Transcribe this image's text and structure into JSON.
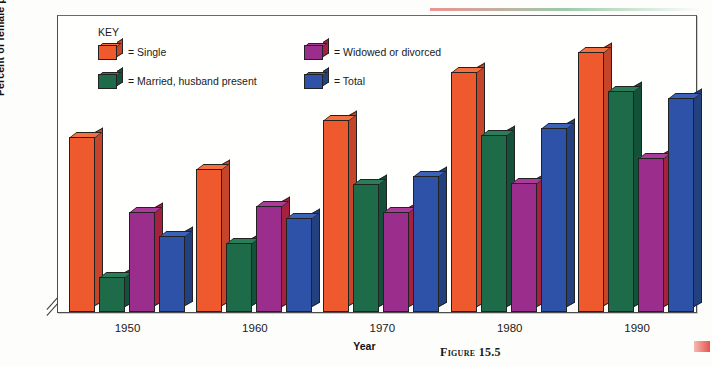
{
  "figure": {
    "caption": "Figure 15.5"
  },
  "chart_data": {
    "type": "bar",
    "title": "",
    "xlabel": "Year",
    "ylabel": "Percent of female population working",
    "categories": [
      "1950",
      "1960",
      "1970",
      "1980",
      "1990"
    ],
    "ylim": [
      17.5,
      72.5
    ],
    "yticks": [
      70,
      65,
      60,
      55,
      50,
      45,
      40,
      35,
      30,
      25,
      20
    ],
    "y_axis_break": true,
    "grid": false,
    "legend_position": "inside-top-left",
    "legend_title": "KEY",
    "series": [
      {
        "name": "Single",
        "label": "= Single",
        "color": "#EE5A2E",
        "values": [
          50.0,
          44.0,
          53.2,
          62.2,
          65.8
        ]
      },
      {
        "name": "Married, husband present",
        "label": "= Married, husband present",
        "color": "#1E6B4A",
        "values": [
          24.0,
          30.2,
          41.3,
          50.5,
          58.7
        ]
      },
      {
        "name": "Widowed or divorced",
        "label": "= Widowed or divorced",
        "color": "#9B2D8C",
        "values": [
          36.0,
          37.2,
          36.1,
          41.5,
          46.2
        ]
      },
      {
        "name": "Total",
        "label": "= Total",
        "color": "#2E52A8",
        "values": [
          31.5,
          35.0,
          42.8,
          51.8,
          57.4
        ]
      }
    ]
  }
}
